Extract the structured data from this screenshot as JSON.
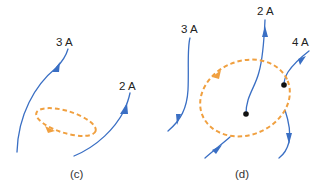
{
  "colors": {
    "current": "#3a6fc4",
    "loop": "#f0a040",
    "dot": "#111111",
    "text": "#222222"
  },
  "panels": [
    {
      "caption": "(c)",
      "currents": [
        {
          "label": "3 A",
          "direction": "up"
        },
        {
          "label": "2 A",
          "direction": "up"
        }
      ],
      "loop": {
        "style": "dashed",
        "direction": "counterclockwise"
      }
    },
    {
      "caption": "(d)",
      "currents": [
        {
          "label": "3 A",
          "direction": "down"
        },
        {
          "label": "2 A",
          "direction": "up",
          "ends_inside_loop": true
        },
        {
          "label": "4 A",
          "direction": "down",
          "ends_inside_loop": true
        }
      ],
      "loop": {
        "style": "dashed",
        "direction": "counterclockwise"
      }
    }
  ]
}
